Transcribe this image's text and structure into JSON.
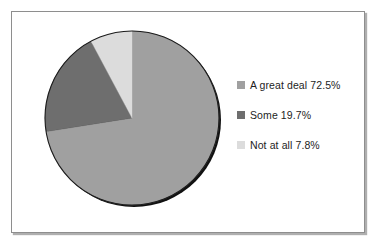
{
  "chart_data": {
    "type": "pie",
    "title": "",
    "subtitle": "",
    "xlabel": "",
    "ylabel": "",
    "grid": false,
    "legend_position": "right",
    "start_angle_deg": 0,
    "direction": "clockwise",
    "categories": [
      "A great deal",
      "Some",
      "Not at all"
    ],
    "values": [
      72.5,
      19.7,
      7.8
    ],
    "value_suffix": "%",
    "colors": [
      "#a0a0a0",
      "#6e6e6e",
      "#dcdcdc"
    ],
    "slices": [
      {
        "label": "A great deal",
        "value": 72.5,
        "display": "72.5%",
        "color": "#a0a0a0"
      },
      {
        "label": "Some",
        "value": 19.7,
        "display": "19.7%",
        "color": "#6e6e6e"
      },
      {
        "label": "Not at all",
        "value": 7.8,
        "display": "7.8%",
        "color": "#dcdcdc"
      }
    ],
    "annotations": []
  },
  "legend": {
    "entries": [
      {
        "marker": "legend-swatch-a-great-deal",
        "text": "A great deal 72.5%",
        "color": "#a0a0a0"
      },
      {
        "marker": "legend-swatch-some",
        "text": "Some 19.7%",
        "color": "#6e6e6e"
      },
      {
        "marker": "legend-swatch-not-at-all",
        "text": "Not at all 7.8%",
        "color": "#dcdcdc"
      }
    ]
  },
  "frame": {
    "border_color": "#8e8e8e",
    "background": "#ffffff"
  },
  "pie": {
    "outline_color": "#141414",
    "center_x": 97,
    "center_y": 99,
    "radius": 87
  }
}
